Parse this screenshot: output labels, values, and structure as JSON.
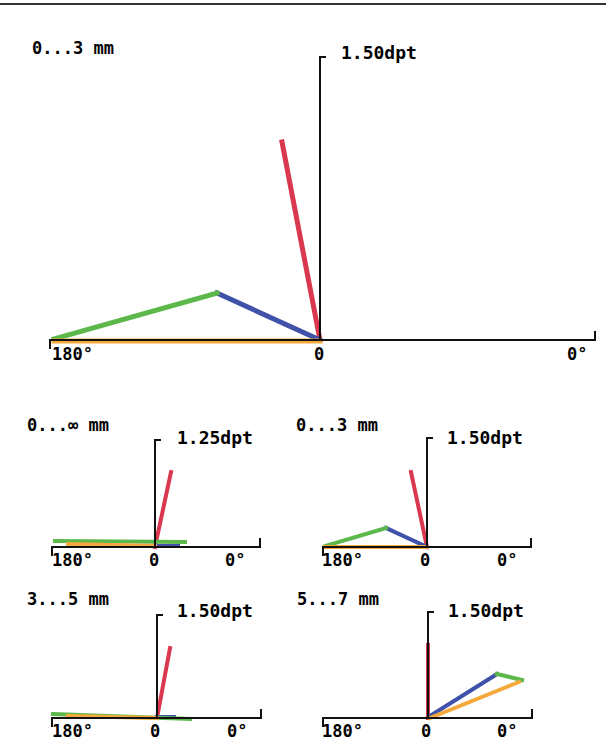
{
  "colors": {
    "red": "#d9384f",
    "blue": "#3f51a8",
    "green": "#5cb84a",
    "orange": "#f5a93c",
    "axis": "#111111"
  },
  "chart_data": [
    {
      "type": "line",
      "title": "0...3 mm",
      "ylabel": "1.50dpt",
      "xtick_labels": [
        "180°",
        "0",
        "0°"
      ],
      "axis": {
        "ox": 320,
        "oy": 340,
        "xmin": 50,
        "xmax": 595,
        "ytop": 57
      },
      "series": [
        {
          "name": "red",
          "color": "#d9384f",
          "points": [
            [
              320,
              340
            ],
            [
              282,
              142
            ]
          ]
        },
        {
          "name": "blue",
          "color": "#3f51a8",
          "points": [
            [
              320,
              340
            ],
            [
              217,
              293
            ]
          ]
        },
        {
          "name": "green",
          "color": "#5cb84a",
          "points": [
            [
              217,
              293
            ],
            [
              54,
              339
            ]
          ]
        },
        {
          "name": "orange",
          "color": "#f5a93c",
          "points": [
            [
              54,
              341
            ],
            [
              320,
              341
            ]
          ]
        }
      ]
    },
    {
      "type": "line",
      "title": "0...∞ mm",
      "ylabel": "1.25dpt",
      "xtick_labels": [
        "180°",
        "0",
        "0°"
      ],
      "axis": {
        "ox": 155,
        "oy": 547,
        "xmin": 52,
        "xmax": 260,
        "ytop": 440
      },
      "series": [
        {
          "name": "red",
          "color": "#d9384f",
          "points": [
            [
              155,
              547
            ],
            [
              171,
              472
            ]
          ]
        },
        {
          "name": "blue",
          "color": "#3f51a8",
          "points": [
            [
              155,
              546
            ],
            [
              178,
              546
            ]
          ]
        },
        {
          "name": "green",
          "color": "#5cb84a",
          "points": [
            [
              55,
              541
            ],
            [
              185,
              542
            ]
          ]
        },
        {
          "name": "orange",
          "color": "#f5a93c",
          "points": [
            [
              68,
              544
            ],
            [
              155,
              546
            ]
          ]
        }
      ]
    },
    {
      "type": "line",
      "title": "0...3 mm",
      "ylabel": "1.50dpt",
      "xtick_labels": [
        "180°",
        "0",
        "0°"
      ],
      "axis": {
        "ox": 427,
        "oy": 547,
        "xmin": 323,
        "xmax": 531,
        "ytop": 438
      },
      "series": [
        {
          "name": "red",
          "color": "#d9384f",
          "points": [
            [
              427,
              547
            ],
            [
              411,
              472
            ]
          ]
        },
        {
          "name": "blue",
          "color": "#3f51a8",
          "points": [
            [
              427,
              547
            ],
            [
              386,
              528
            ]
          ]
        },
        {
          "name": "green",
          "color": "#5cb84a",
          "points": [
            [
              386,
              528
            ],
            [
              325,
              546
            ]
          ]
        },
        {
          "name": "orange",
          "color": "#f5a93c",
          "points": [
            [
              325,
              547
            ],
            [
              427,
              547
            ]
          ]
        }
      ]
    },
    {
      "type": "line",
      "title": "3...5 mm",
      "ylabel": "1.50dpt",
      "xtick_labels": [
        "180°",
        "0",
        "0°"
      ],
      "axis": {
        "ox": 157,
        "oy": 718,
        "xmin": 52,
        "xmax": 261,
        "ytop": 615
      },
      "series": [
        {
          "name": "red",
          "color": "#d9384f",
          "points": [
            [
              157,
              718
            ],
            [
              170,
              648
            ]
          ]
        },
        {
          "name": "blue",
          "color": "#3f51a8",
          "points": [
            [
              157,
              717
            ],
            [
              174,
              717
            ]
          ]
        },
        {
          "name": "green",
          "color": "#5cb84a",
          "points": [
            [
              53,
              714
            ],
            [
              190,
              719
            ]
          ]
        },
        {
          "name": "orange",
          "color": "#f5a93c",
          "points": [
            [
              68,
              716
            ],
            [
              157,
              718
            ]
          ]
        }
      ]
    },
    {
      "type": "line",
      "title": "5...7 mm",
      "ylabel": "1.50dpt",
      "xtick_labels": [
        "180°",
        "0",
        "0°"
      ],
      "axis": {
        "ox": 428,
        "oy": 718,
        "xmin": 323,
        "xmax": 532,
        "ytop": 612
      },
      "series": [
        {
          "name": "red",
          "color": "#d9384f",
          "points": [
            [
              428,
              718
            ],
            [
              428,
              645
            ]
          ]
        },
        {
          "name": "blue",
          "color": "#3f51a8",
          "points": [
            [
              430,
              716
            ],
            [
              497,
              674
            ]
          ]
        },
        {
          "name": "green",
          "color": "#5cb84a",
          "points": [
            [
              497,
              674
            ],
            [
              522,
              680
            ]
          ]
        },
        {
          "name": "orange",
          "color": "#f5a93c",
          "points": [
            [
              430,
              718
            ],
            [
              519,
              682
            ]
          ]
        }
      ]
    }
  ]
}
